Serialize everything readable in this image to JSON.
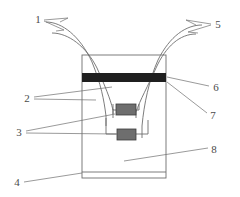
{
  "figure": {
    "type": "technical-line-drawing",
    "background_color": "#ffffff",
    "line_color": "#6e6e6e",
    "band_color": "#1f1f1f",
    "block_color": "#6e6e6e",
    "callouts": [
      {
        "id": "1",
        "label": "1",
        "x": 38,
        "y": 20,
        "refers_to": "left-inlet-tube"
      },
      {
        "id": "2",
        "label": "2",
        "x": 27,
        "y": 100,
        "refers_to": "tube-inner-wall"
      },
      {
        "id": "3",
        "label": "3",
        "x": 19,
        "y": 134,
        "refers_to": "sensor-blocks"
      },
      {
        "id": "4",
        "label": "4",
        "x": 17,
        "y": 186,
        "refers_to": "base-plate"
      },
      {
        "id": "5",
        "label": "5",
        "x": 216,
        "y": 26,
        "refers_to": "right-outlet-tube"
      },
      {
        "id": "6",
        "label": "6",
        "x": 216,
        "y": 89,
        "refers_to": "dark-band"
      },
      {
        "id": "7",
        "label": "7",
        "x": 213,
        "y": 117,
        "refers_to": "container-right-wall"
      },
      {
        "id": "8",
        "label": "8",
        "x": 214,
        "y": 152,
        "refers_to": "container-body"
      }
    ],
    "parts": {
      "container": {
        "x": 82,
        "y": 55,
        "width": 84,
        "height": 123
      },
      "base_plate": {
        "x": 82,
        "y": 172,
        "width": 84,
        "height": 6
      },
      "dark_band": {
        "x": 82,
        "y": 73,
        "width": 84,
        "height": 9
      },
      "block_upper": {
        "x": 116,
        "y": 104,
        "width": 20,
        "height": 11
      },
      "block_lower": {
        "x": 117,
        "y": 129,
        "width": 19,
        "height": 11
      }
    }
  }
}
